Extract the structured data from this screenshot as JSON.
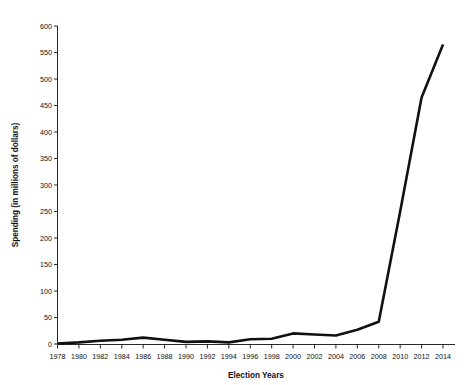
{
  "chart_data": {
    "type": "line",
    "title": "",
    "subtitle": "",
    "xlabel": "Election Years",
    "ylabel": "Spending (in millions of dollars)",
    "xlim": [
      1978,
      2014
    ],
    "ylim": [
      0,
      600
    ],
    "ytick_step": 50,
    "xtick_step": 2,
    "grid": false,
    "legend": false,
    "legend_position": "none",
    "line_color": "#111111",
    "x": [
      1978,
      1980,
      1982,
      1984,
      1986,
      1988,
      1990,
      1992,
      1994,
      1996,
      1998,
      2000,
      2002,
      2004,
      2006,
      2008,
      2010,
      2012,
      2014
    ],
    "categories": [
      "1978",
      "1980",
      "1982",
      "1984",
      "1986",
      "1988",
      "1990",
      "1992",
      "1994",
      "1996",
      "1998",
      "2000",
      "2002",
      "2004",
      "2006",
      "2008",
      "2010",
      "2012",
      "2014"
    ],
    "series": [
      {
        "name": "Outside spending",
        "values": [
          1,
          3,
          6,
          8,
          12,
          8,
          4,
          5,
          3,
          9,
          10,
          20,
          18,
          16,
          27,
          42,
          250,
          465,
          565
        ]
      }
    ],
    "yticks": [
      0,
      50,
      100,
      150,
      200,
      250,
      300,
      350,
      400,
      450,
      500,
      550,
      600
    ],
    "ytick_labels": [
      "0",
      "50",
      "100",
      "150",
      "200",
      "250",
      "300",
      "350",
      "400",
      "450",
      "500",
      "550",
      "600"
    ],
    "xticks": [
      1978,
      1980,
      1982,
      1984,
      1986,
      1988,
      1990,
      1992,
      1994,
      1996,
      1998,
      2000,
      2002,
      2004,
      2006,
      2008,
      2010,
      2012,
      2014
    ],
    "xtick_labels": [
      "1978",
      "1980",
      "1982",
      "1984",
      "1986",
      "1988",
      "1990",
      "1992",
      "1994",
      "1996",
      "1998",
      "2000",
      "2002",
      "2004",
      "2006",
      "2008",
      "2010",
      "2012",
      "2014"
    ],
    "annotations": []
  }
}
